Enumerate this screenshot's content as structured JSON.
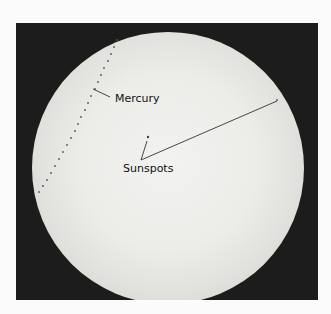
{
  "figure": {
    "labels": {
      "mercury": "Mercury",
      "sunspots": "Sunspots"
    },
    "colors": {
      "background": "#fbfbfb",
      "frame": "#1c1c1c",
      "sun_center": "#f2f2f0",
      "sun_limb": "#8e8e8a",
      "annotation_line": "#333333"
    }
  }
}
